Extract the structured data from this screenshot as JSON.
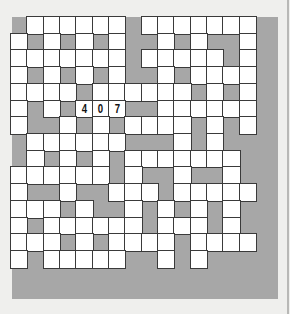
{
  "puzzle": {
    "rows": 15,
    "cols": 15,
    "colors": {
      "background": "#efefed",
      "frame": "#a7a7a7",
      "cell": "#ffffff",
      "cell_border": "#3a3a3a",
      "digit": "#111111"
    },
    "layout": [
      "#WWWWWW#WWWWWWW",
      "W#W#W#W##W#W##W",
      "WWWWWWW#WWWWW#W",
      "W#W#W#W##W#WWWW",
      "WWWW#WWWWWW#W#W",
      "W#W#WWW##WWWWWW",
      "W##W#W#WWWW#W#W",
      "#WWWWWW###W#W##",
      "#W#W#W#WWWWWWW#",
      "WWWWWW#W##W##W#",
      "W##W##WWW#WWWWW",
      "WWW#W##W#W#W#W#",
      "W#WWWWWW#WWW#W#",
      "WWW#W#WWWW#WWWW",
      "W#WWWWW##W#W###"
    ],
    "filled": [
      {
        "row": 5,
        "col": 4,
        "value": "4"
      },
      {
        "row": 5,
        "col": 5,
        "value": "0"
      },
      {
        "row": 5,
        "col": 6,
        "value": "7"
      }
    ]
  }
}
